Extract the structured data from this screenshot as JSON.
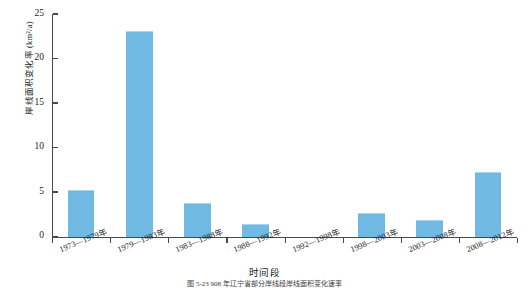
{
  "chart_data": {
    "type": "bar",
    "title": "",
    "xlabel": "时间段",
    "ylabel": "岸线面积变化率 (km²/a)",
    "categories": [
      "1973—1979年",
      "1979—1983年",
      "1983—1988年",
      "1988—1992年",
      "1992—1998年",
      "1998—2003年",
      "2003—2008年",
      "2008—2012年"
    ],
    "values": [
      5.1,
      23.0,
      3.7,
      1.3,
      0,
      2.5,
      1.7,
      7.1
    ],
    "ylim": [
      0,
      25
    ],
    "yticks": [
      0,
      5,
      10,
      15,
      20,
      25
    ],
    "ytick_labels": [
      "0",
      "5",
      "10",
      "15",
      "20",
      "25"
    ],
    "grid": false,
    "legend": "none",
    "bar_color": "#6FB9E2",
    "axis_color": "#4a4a4a"
  },
  "figure": {
    "caption": "图 5-23  908 年辽宁省部分岸线段岸线面积变化速率"
  }
}
